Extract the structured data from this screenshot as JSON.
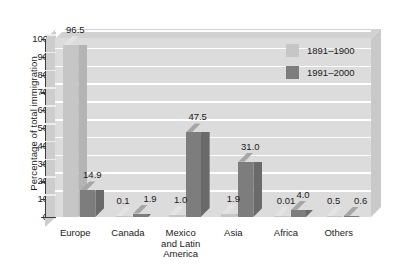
{
  "chart_data": {
    "type": "bar",
    "title": "",
    "subtitle": "",
    "xlabel": "",
    "ylabel": "Percentage of total immigration",
    "ylim": [
      0,
      100
    ],
    "yticks": [
      "100",
      "90",
      "80",
      "70",
      "60",
      "50",
      "40",
      "30",
      "20",
      "10",
      "0"
    ],
    "grid": true,
    "legend_position": "top-right",
    "style": "3d-grouped-bar",
    "categories": [
      "Europe",
      "Canada",
      "Mexico\nand Latin\nAmerica",
      "Asia",
      "Africa",
      "Others"
    ],
    "series": [
      {
        "name": "1891–1900",
        "color": "#c6c6c6",
        "values": [
          96.5,
          0.1,
          1.0,
          1.9,
          0.01,
          0.5
        ],
        "labels": [
          "96.5",
          "0.1",
          "1.0",
          "1.9",
          "0.01",
          "0.5"
        ]
      },
      {
        "name": "1991–2000",
        "color": "#7d7d7d",
        "values": [
          14.9,
          1.9,
          47.5,
          31.0,
          4.0,
          0.6
        ],
        "labels": [
          "14.9",
          "1.9",
          "47.5",
          "31.0",
          "4.0",
          "0.6"
        ]
      }
    ]
  },
  "colors": {
    "plot_background": "#dcdcdc",
    "gridline": "#ffffff",
    "axis": "#3a3a3a",
    "text": "#1a1a1a",
    "page_background": "#ffffff"
  }
}
